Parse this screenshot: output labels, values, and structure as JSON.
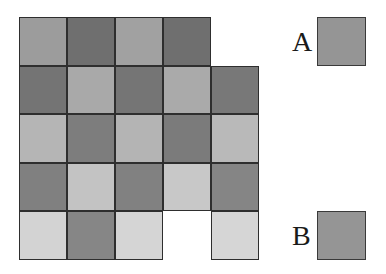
{
  "figure": {
    "grid": {
      "rows": 5,
      "cols": 5,
      "tiles": [
        [
          "#9c9c9c",
          "#6f6f6f",
          "#a1a1a1",
          "#6f6f6f",
          null
        ],
        [
          "#747474",
          "#a9a9a9",
          "#757575",
          "#aaaaaa",
          "#787878"
        ],
        [
          "#b5b5b5",
          "#7d7d7d",
          "#b4b4b4",
          "#7b7b7b",
          "#b9b9b9"
        ],
        [
          "#808080",
          "#c3c3c3",
          "#818181",
          "#c8c8c8",
          "#858585"
        ],
        [
          "#d3d3d3",
          "#868686",
          "#d5d5d5",
          null,
          "#d6d6d6"
        ]
      ]
    },
    "references": [
      {
        "label": "A",
        "color": "#959595"
      },
      {
        "label": "B",
        "color": "#959595"
      }
    ]
  }
}
